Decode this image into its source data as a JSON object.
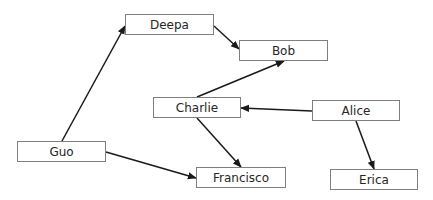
{
  "diagram": {
    "type": "directed-graph",
    "nodes": [
      {
        "id": "deepa",
        "label": "Deepa",
        "x": 125,
        "y": 14,
        "w": 89,
        "h": 21
      },
      {
        "id": "bob",
        "label": "Bob",
        "x": 239,
        "y": 40,
        "w": 89,
        "h": 21
      },
      {
        "id": "charlie",
        "label": "Charlie",
        "x": 153,
        "y": 97,
        "w": 88,
        "h": 21
      },
      {
        "id": "alice",
        "label": "Alice",
        "x": 312,
        "y": 100,
        "w": 88,
        "h": 21
      },
      {
        "id": "guo",
        "label": "Guo",
        "x": 17,
        "y": 141,
        "w": 89,
        "h": 21
      },
      {
        "id": "francisco",
        "label": "Francisco",
        "x": 196,
        "y": 167,
        "w": 90,
        "h": 21
      },
      {
        "id": "erica",
        "label": "Erica",
        "x": 330,
        "y": 169,
        "w": 88,
        "h": 21
      }
    ],
    "edges": [
      {
        "from": "guo",
        "to": "deepa",
        "x1": 62,
        "y1": 141,
        "x2": 125,
        "y2": 26
      },
      {
        "from": "deepa",
        "to": "bob",
        "x1": 214,
        "y1": 26,
        "x2": 239,
        "y2": 49
      },
      {
        "from": "charlie",
        "to": "bob",
        "x1": 197,
        "y1": 97,
        "x2": 284,
        "y2": 61
      },
      {
        "from": "alice",
        "to": "charlie",
        "x1": 312,
        "y1": 111,
        "x2": 241,
        "y2": 108
      },
      {
        "from": "charlie",
        "to": "francisco",
        "x1": 197,
        "y1": 118,
        "x2": 241,
        "y2": 167
      },
      {
        "from": "guo",
        "to": "francisco",
        "x1": 106,
        "y1": 152,
        "x2": 196,
        "y2": 178
      },
      {
        "from": "alice",
        "to": "erica",
        "x1": 356,
        "y1": 121,
        "x2": 374,
        "y2": 169
      }
    ],
    "colors": {
      "edge": "#1a1a1a",
      "node_border": "#7f7f7f",
      "text": "#262626"
    }
  }
}
